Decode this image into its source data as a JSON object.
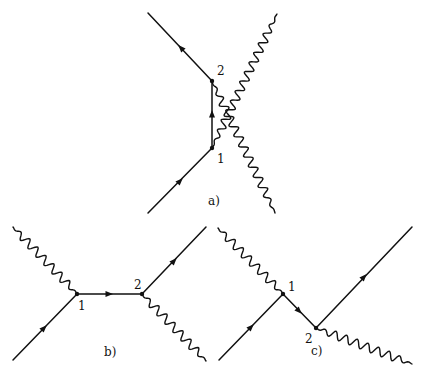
{
  "figure": {
    "colors": {
      "ink": "#111111",
      "background": "#ffffff"
    },
    "diagrams": [
      {
        "id": "a",
        "caption": "a)",
        "caption_pos": [
          208,
          205
        ],
        "vertices": [
          {
            "label": "1",
            "pos": [
              212,
              148
            ],
            "label_pos": [
              217,
              163
            ]
          },
          {
            "label": "2",
            "pos": [
              212,
              81
            ],
            "label_pos": [
              217,
              75
            ]
          }
        ],
        "fermion_lines": [
          {
            "from": [
              148,
              213
            ],
            "to": [
              212,
              148
            ],
            "arrow_at": [
              180,
              181
            ]
          },
          {
            "from": [
              212,
              148
            ],
            "to": [
              212,
              81
            ],
            "arrow_at": [
              212,
              114
            ]
          },
          {
            "from": [
              212,
              81
            ],
            "to": [
              148,
              13
            ],
            "arrow_at": [
              181,
              48
            ]
          }
        ],
        "photon_lines": [
          {
            "from": [
              212,
              148
            ],
            "to": [
              277,
              14
            ],
            "type": "wavy"
          },
          {
            "from": [
              212,
              81
            ],
            "to": [
              275,
              213
            ],
            "type": "wavy"
          }
        ]
      },
      {
        "id": "b",
        "caption": "b)",
        "caption_pos": [
          104,
          356
        ],
        "vertices": [
          {
            "label": "1",
            "pos": [
              77,
              294
            ],
            "label_pos": [
              78,
              310
            ]
          },
          {
            "label": "2",
            "pos": [
              142,
              294
            ],
            "label_pos": [
              134,
              289
            ]
          }
        ],
        "fermion_lines": [
          {
            "from": [
              13,
              360
            ],
            "to": [
              77,
              294
            ],
            "arrow_at": [
              44,
              328
            ]
          },
          {
            "from": [
              77,
              294
            ],
            "to": [
              142,
              294
            ],
            "arrow_at": [
              109,
              294
            ]
          },
          {
            "from": [
              142,
              294
            ],
            "to": [
              206,
              227
            ],
            "arrow_at": [
              174,
              261
            ]
          }
        ],
        "photon_lines": [
          {
            "from": [
              13,
              227
            ],
            "to": [
              77,
              294
            ],
            "type": "wavy"
          },
          {
            "from": [
              142,
              294
            ],
            "to": [
              206,
              361
            ],
            "type": "wavy"
          }
        ]
      },
      {
        "id": "c",
        "caption": "c)",
        "caption_pos": [
          311,
          355
        ],
        "vertices": [
          {
            "label": "1",
            "pos": [
              283,
              294
            ],
            "label_pos": [
              288,
              291
            ]
          },
          {
            "label": "2",
            "pos": [
              316,
              328
            ],
            "label_pos": [
              305,
              343
            ]
          }
        ],
        "fermion_lines": [
          {
            "from": [
              219,
              360
            ],
            "to": [
              283,
              294
            ],
            "arrow_at": [
              251,
              327
            ]
          },
          {
            "from": [
              283,
              294
            ],
            "to": [
              316,
              328
            ],
            "arrow_at": [
              299,
              311
            ]
          },
          {
            "from": [
              316,
              328
            ],
            "to": [
              412,
              227
            ],
            "arrow_at": [
              364,
              277
            ]
          }
        ],
        "photon_lines": [
          {
            "from": [
              218,
              228
            ],
            "to": [
              283,
              294
            ],
            "type": "wavy"
          },
          {
            "from": [
              316,
              328
            ],
            "to": [
              412,
              364
            ],
            "type": "wavy"
          }
        ]
      }
    ]
  }
}
